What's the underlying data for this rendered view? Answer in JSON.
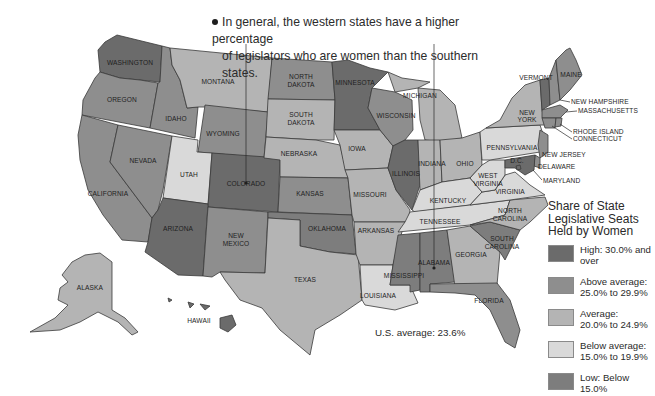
{
  "callout": {
    "line1": "In general, the western states have a higher percentage",
    "line2": "of legislators who are women than the southern states.",
    "marker": "bullet-dot",
    "pointers_to": [
      "COLORADO",
      "ALABAMA"
    ]
  },
  "legend": {
    "title_line1": "Share of State",
    "title_line2": "Legislative Seats",
    "title_line3": "Held by Women",
    "items": [
      {
        "key": "high",
        "line1": "High: 30.0% and",
        "line2": "over",
        "color": "#6b6b6b"
      },
      {
        "key": "above",
        "line1": "Above average:",
        "line2": "25.0% to 29.9%",
        "color": "#8e8e8e"
      },
      {
        "key": "average",
        "line1": "Average:",
        "line2": "20.0% to 24.9%",
        "color": "#b4b4b4"
      },
      {
        "key": "below",
        "line1": "Below average:",
        "line2": "15.0% to 19.9%",
        "color": "#d9d9d9"
      },
      {
        "key": "low",
        "line1": "Low: Below",
        "line2": "15.0%",
        "color": "#7d7d7d"
      }
    ]
  },
  "us_average": "U.S. average: 23.6%",
  "colors": {
    "high": "#6b6b6b",
    "above": "#8e8e8e",
    "average": "#b4b4b4",
    "below": "#d9d9d9",
    "low": "#7d7d7d",
    "water": "#ffffff",
    "border": "#3a3a3a"
  },
  "states": {
    "WA": {
      "label": "WASHINGTON",
      "category": "high"
    },
    "OR": {
      "label": "OREGON",
      "category": "above"
    },
    "CA": {
      "label": "CALIFORNIA",
      "category": "above"
    },
    "ID": {
      "label": "IDAHO",
      "category": "above"
    },
    "NV": {
      "label": "NEVADA",
      "category": "above"
    },
    "MT": {
      "label": "MONTANA",
      "category": "average"
    },
    "WY": {
      "label": "WYOMING",
      "category": "above"
    },
    "UT": {
      "label": "UTAH",
      "category": "below"
    },
    "CO": {
      "label": "COLORADO",
      "category": "high"
    },
    "AZ": {
      "label": "ARIZONA",
      "category": "high"
    },
    "NM": {
      "label": "NEW MEXICO",
      "category": "above"
    },
    "ND": {
      "label_line1": "NORTH",
      "label_line2": "DAKOTA",
      "category": "above"
    },
    "SD": {
      "label_line1": "SOUTH",
      "label_line2": "DAKOTA",
      "category": "average"
    },
    "NE": {
      "label": "NEBRASKA",
      "category": "average"
    },
    "KS": {
      "label": "KANSAS",
      "category": "above"
    },
    "OK": {
      "label": "OKLAHOMA",
      "category": "low"
    },
    "TX": {
      "label": "TEXAS",
      "category": "average"
    },
    "MN": {
      "label": "MINNESOTA",
      "category": "high"
    },
    "IA": {
      "label": "IOWA",
      "category": "average"
    },
    "MO": {
      "label": "MISSOURI",
      "category": "average"
    },
    "AR": {
      "label": "ARKANSAS",
      "category": "average"
    },
    "LA": {
      "label": "LOUISIANA",
      "category": "below"
    },
    "WI": {
      "label": "WISCONSIN",
      "category": "above"
    },
    "IL": {
      "label": "ILLINOIS",
      "category": "high"
    },
    "MI": {
      "label": "MICHIGAN",
      "category": "average"
    },
    "IN": {
      "label": "INDIANA",
      "category": "average"
    },
    "OH": {
      "label": "OHIO",
      "category": "average"
    },
    "KY": {
      "label": "KENTUCKY",
      "category": "below"
    },
    "TN": {
      "label": "TENNESSEE",
      "category": "below"
    },
    "MS": {
      "label": "MISSISSIPPI",
      "category": "low"
    },
    "AL": {
      "label": "ALABAMA",
      "category": "low"
    },
    "GA": {
      "label": "GEORGIA",
      "category": "average"
    },
    "FL": {
      "label": "FLORIDA",
      "category": "above"
    },
    "SC": {
      "label_line1": "SOUTH",
      "label_line2": "CAROLINA",
      "category": "low"
    },
    "NC": {
      "label_line1": "NORTH",
      "label_line2": "CAROLINA",
      "category": "average"
    },
    "VA": {
      "label": "VIRGINIA",
      "category": "below"
    },
    "WV": {
      "label_line1": "WEST",
      "label_line2": "VIRGINIA",
      "category": "below"
    },
    "PA": {
      "label": "PENNSYLVANIA",
      "category": "below"
    },
    "NY": {
      "label_line1": "NEW",
      "label_line2": "YORK",
      "category": "average"
    },
    "VT": {
      "label": "VERMONT",
      "category": "high"
    },
    "NH": {
      "label": "NEW HAMPSHIRE",
      "category": "above"
    },
    "ME": {
      "label": "MAINE",
      "category": "above"
    },
    "MA": {
      "label": "MASSACHUSETTS",
      "category": "above"
    },
    "RI": {
      "label": "RHODE ISLAND",
      "category": "above"
    },
    "CT": {
      "label": "CONNECTICUT",
      "category": "above"
    },
    "NJ": {
      "label": "NEW JERSEY",
      "category": "above"
    },
    "DE": {
      "label": "DELAWARE",
      "category": "above"
    },
    "MD": {
      "label": "MARYLAND",
      "category": "high"
    },
    "DC": {
      "label": "D.C.",
      "category": "high"
    },
    "AK": {
      "label": "ALASKA",
      "category": "average"
    },
    "HI": {
      "label": "HAWAII",
      "category": "high"
    }
  }
}
